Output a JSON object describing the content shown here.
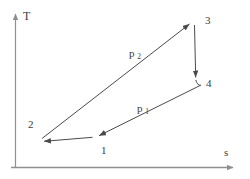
{
  "diagram": {
    "type": "T-s thermodynamic cycle diagram",
    "y_axis_label": "T",
    "x_axis_label": "s",
    "state_points": [
      {
        "label": "1"
      },
      {
        "label": "2"
      },
      {
        "label": "3"
      },
      {
        "label": "4"
      }
    ],
    "isobars": [
      {
        "base": "p",
        "sub": "2"
      },
      {
        "base": "p",
        "sub": "1"
      }
    ],
    "process_arrows": [
      "1-2",
      "2-3",
      "3-4",
      "4-1"
    ],
    "colors": {
      "axis": "#8f8f8f",
      "process": "#4a4a4a",
      "text": "#3d3d3d",
      "background": "#ffffff"
    }
  }
}
